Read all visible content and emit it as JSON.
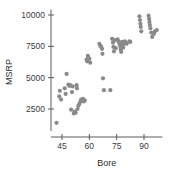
{
  "chart_data": {
    "type": "scatter",
    "title": "",
    "xlabel": "Bore",
    "ylabel": "MSRP",
    "xticks": [
      45,
      60,
      75,
      90
    ],
    "yticks": [
      2500,
      5000,
      7500,
      10000
    ],
    "xlim": [
      40,
      99
    ],
    "ylim": [
      1100,
      10200
    ],
    "grid": false,
    "legend": null,
    "marker_color": "#8a8a8a",
    "axis_color": "#5a5a5a",
    "points": [
      [
        42.0,
        1400
      ],
      [
        43.5,
        3500
      ],
      [
        43.8,
        3950
      ],
      [
        44.5,
        3250
      ],
      [
        46.5,
        4150
      ],
      [
        47.0,
        3700
      ],
      [
        47.5,
        5300
      ],
      [
        48.5,
        4450
      ],
      [
        49.0,
        4350
      ],
      [
        49.5,
        4400
      ],
      [
        50.0,
        2450
      ],
      [
        50.5,
        3850
      ],
      [
        50.8,
        4300
      ],
      [
        51.5,
        2150
      ],
      [
        52.0,
        2300
      ],
      [
        52.5,
        2200
      ],
      [
        53.0,
        4400
      ],
      [
        53.2,
        4150
      ],
      [
        53.5,
        2500
      ],
      [
        54.0,
        2750
      ],
      [
        54.5,
        2900
      ],
      [
        55.0,
        3050
      ],
      [
        55.5,
        3250
      ],
      [
        56.0,
        3150
      ],
      [
        56.5,
        3300
      ],
      [
        57.0,
        3100
      ],
      [
        57.5,
        3200
      ],
      [
        58.5,
        6450
      ],
      [
        58.8,
        6300
      ],
      [
        59.2,
        6750
      ],
      [
        59.5,
        6600
      ],
      [
        60.0,
        6500
      ],
      [
        60.5,
        6200
      ],
      [
        65.5,
        7700
      ],
      [
        66.0,
        7550
      ],
      [
        66.5,
        7450
      ],
      [
        67.0,
        7300
      ],
      [
        67.2,
        6900
      ],
      [
        67.5,
        4950
      ],
      [
        68.0,
        4000
      ],
      [
        71.5,
        4000
      ],
      [
        72.5,
        8100
      ],
      [
        73.0,
        7800
      ],
      [
        73.2,
        7450
      ],
      [
        73.5,
        7100
      ],
      [
        74.0,
        8000
      ],
      [
        74.5,
        7350
      ],
      [
        75.5,
        8050
      ],
      [
        76.0,
        7900
      ],
      [
        76.5,
        7700
      ],
      [
        77.0,
        7500
      ],
      [
        77.2,
        7250
      ],
      [
        77.5,
        7050
      ],
      [
        78.0,
        7850
      ],
      [
        78.3,
        7600
      ],
      [
        78.6,
        7400
      ],
      [
        79.0,
        7750
      ],
      [
        79.5,
        7900
      ],
      [
        80.0,
        7800
      ],
      [
        80.5,
        7700
      ],
      [
        82.0,
        7900
      ],
      [
        82.5,
        7850
      ],
      [
        87.5,
        9900
      ],
      [
        87.8,
        9600
      ],
      [
        88.0,
        9300
      ],
      [
        88.2,
        9050
      ],
      [
        88.5,
        8700
      ],
      [
        92.5,
        9950
      ],
      [
        92.8,
        9700
      ],
      [
        93.0,
        9450
      ],
      [
        93.2,
        9200
      ],
      [
        93.5,
        8950
      ],
      [
        94.0,
        8600
      ],
      [
        94.5,
        8250
      ],
      [
        95.5,
        8500
      ],
      [
        96.0,
        8700
      ],
      [
        97.0,
        8800
      ]
    ]
  }
}
